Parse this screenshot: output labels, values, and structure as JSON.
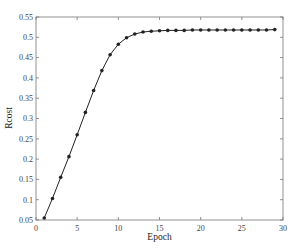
{
  "chart_data": {
    "type": "line",
    "title": "",
    "xlabel": "Epoch",
    "ylabel": "Rcost",
    "xlim": [
      0,
      30
    ],
    "ylim": [
      0.05,
      0.55
    ],
    "xticks": [
      0,
      5,
      10,
      15,
      20,
      25,
      30
    ],
    "yticks": [
      0.05,
      0.1,
      0.15,
      0.2,
      0.25,
      0.3,
      0.35,
      0.4,
      0.45,
      0.5,
      0.55
    ],
    "xtick_labels": [
      "0",
      "5",
      "10",
      "15",
      "20",
      "25",
      "30"
    ],
    "ytick_labels": [
      "0.05",
      "0.1",
      "0.15",
      "0.2",
      "0.25",
      "0.3",
      "0.35",
      "0.4",
      "0.45",
      "0.5",
      "0.55"
    ],
    "grid": false,
    "legend": null,
    "series": [
      {
        "name": "Rcost",
        "marker": "filled-circle",
        "color": "#222222",
        "x": [
          1,
          2,
          3,
          4,
          5,
          6,
          7,
          8,
          9,
          10,
          11,
          12,
          13,
          14,
          15,
          16,
          17,
          18,
          19,
          20,
          21,
          22,
          23,
          24,
          25,
          26,
          27,
          28,
          29
        ],
        "values": [
          0.055,
          0.103,
          0.155,
          0.206,
          0.26,
          0.315,
          0.369,
          0.418,
          0.457,
          0.483,
          0.499,
          0.508,
          0.513,
          0.515,
          0.516,
          0.517,
          0.517,
          0.517,
          0.518,
          0.518,
          0.518,
          0.518,
          0.518,
          0.518,
          0.518,
          0.518,
          0.518,
          0.518,
          0.519
        ]
      }
    ]
  }
}
